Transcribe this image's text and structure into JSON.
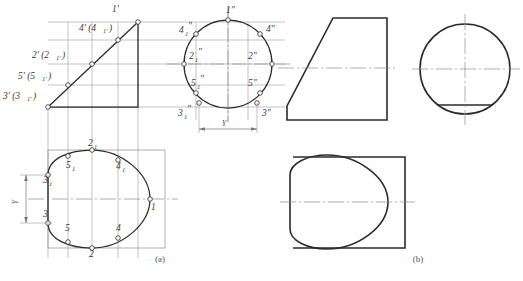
{
  "figure": {
    "title_captions": [
      {
        "key": "a",
        "text": "(a)"
      },
      {
        "key": "b",
        "text": "(b)"
      }
    ],
    "background_color": "#ffffff",
    "outline_color": "#2b2b2b",
    "projection_line_color": "#8c8c8c",
    "centerline_color": "#8c8c8c",
    "label_color": "#3a3a3a"
  },
  "part_a": {
    "front_view": {
      "name": "front-view-triangle",
      "point_labels": [
        {
          "id": "p1f",
          "text": "1'",
          "x": 112,
          "y": 12
        },
        {
          "id": "p4f",
          "text": "4' (4",
          "x": 79,
          "y": 31
        },
        {
          "id": "p4f2",
          "text": "1'",
          "x": 103,
          "y": 33
        },
        {
          "id": "p4fc",
          "text": ")",
          "x": 110,
          "y": 31
        },
        {
          "id": "p2f",
          "text": "2' (2",
          "x": 32,
          "y": 58
        },
        {
          "id": "p2f2",
          "text": "1'",
          "x": 57,
          "y": 60
        },
        {
          "id": "p2fc",
          "text": ")",
          "x": 64,
          "y": 58
        },
        {
          "id": "p5f",
          "text": "5' (5",
          "x": 18,
          "y": 79
        },
        {
          "id": "p5f2",
          "text": "1'",
          "x": 43,
          "y": 81
        },
        {
          "id": "p5fc",
          "text": ")",
          "x": 50,
          "y": 79
        },
        {
          "id": "p3f",
          "text": "3' (3",
          "x": 4,
          "y": 99
        },
        {
          "id": "p3f2",
          "text": "1'",
          "x": 29,
          "y": 101
        },
        {
          "id": "p3fc",
          "text": ")",
          "x": 36,
          "y": 99
        }
      ]
    },
    "side_view": {
      "name": "side-view-circle",
      "point_labels": [
        {
          "id": "s1",
          "text": "1\"",
          "x": 226,
          "y": 13
        },
        {
          "id": "s4a",
          "text": "4",
          "x": 180,
          "y": 31
        },
        {
          "id": "s4as",
          "text": "1",
          "x": 185,
          "y": 34
        },
        {
          "id": "s4aq",
          "text": "\"",
          "x": 189,
          "y": 29
        },
        {
          "id": "s4b",
          "text": "4\"",
          "x": 268,
          "y": 32
        },
        {
          "id": "s2a",
          "text": "2",
          "x": 190,
          "y": 57
        },
        {
          "id": "s2as",
          "text": "1",
          "x": 196,
          "y": 60
        },
        {
          "id": "s2aq",
          "text": "\"",
          "x": 200,
          "y": 55
        },
        {
          "id": "s2b",
          "text": "2\"",
          "x": 250,
          "y": 57
        },
        {
          "id": "s5a",
          "text": "5",
          "x": 192,
          "y": 84
        },
        {
          "id": "s5as",
          "text": "1",
          "x": 198,
          "y": 87
        },
        {
          "id": "s5aq",
          "text": "\"",
          "x": 202,
          "y": 82
        },
        {
          "id": "s5b",
          "text": "5\"",
          "x": 250,
          "y": 84
        },
        {
          "id": "s3a",
          "text": "3",
          "x": 180,
          "y": 112
        },
        {
          "id": "s3as",
          "text": "1",
          "x": 186,
          "y": 115
        },
        {
          "id": "s3aq",
          "text": "\"",
          "x": 190,
          "y": 110
        },
        {
          "id": "s3b",
          "text": "3\"",
          "x": 262,
          "y": 112
        }
      ],
      "dimension": {
        "label": "Y",
        "x": 221,
        "y": 128
      }
    },
    "top_view": {
      "name": "top-view-oval",
      "point_labels": [
        {
          "id": "t2a",
          "text": "2",
          "x": 92,
          "y": 143
        },
        {
          "id": "t2as",
          "text": "1",
          "x": 98,
          "y": 146
        },
        {
          "id": "t5a",
          "text": "5",
          "x": 68,
          "y": 166
        },
        {
          "id": "t5as",
          "text": "1",
          "x": 74,
          "y": 169
        },
        {
          "id": "t4a",
          "text": "4",
          "x": 118,
          "y": 167
        },
        {
          "id": "t4as",
          "text": "1",
          "x": 124,
          "y": 170
        },
        {
          "id": "t3a",
          "text": "3",
          "x": 44,
          "y": 180
        },
        {
          "id": "t3as",
          "text": "1",
          "x": 50,
          "y": 183
        },
        {
          "id": "t3b",
          "text": "3",
          "x": 44,
          "y": 214
        },
        {
          "id": "t5b",
          "text": "5",
          "x": 67,
          "y": 228
        },
        {
          "id": "t4b",
          "text": "4",
          "x": 118,
          "y": 228
        },
        {
          "id": "t2b",
          "text": "2",
          "x": 92,
          "y": 253
        },
        {
          "id": "t1",
          "text": "1",
          "x": 152,
          "y": 206
        }
      ],
      "dimension": {
        "label": "Y",
        "x": 16,
        "y": 197
      }
    }
  },
  "part_b": {
    "front_view": {
      "name": "b-front-view-trapezoid"
    },
    "side_view": {
      "name": "b-side-view-circle"
    },
    "top_view": {
      "name": "b-top-view-oval"
    }
  }
}
